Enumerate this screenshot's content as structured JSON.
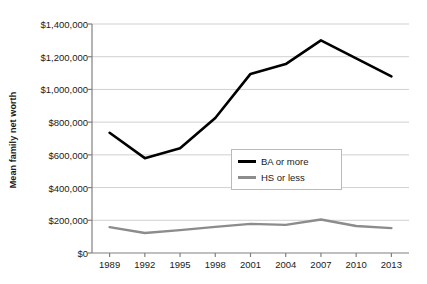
{
  "chart_data": {
    "type": "line",
    "title": "",
    "xlabel": "",
    "ylabel": "Mean family net worth",
    "x": [
      1989,
      1992,
      1995,
      1998,
      2001,
      2004,
      2007,
      2010,
      2013
    ],
    "categories": [
      "1989",
      "1992",
      "1995",
      "1998",
      "2001",
      "2004",
      "2007",
      "2010",
      "2013"
    ],
    "series": [
      {
        "name": "BA or more",
        "color": "#000000",
        "values": [
          735000,
          580000,
          640000,
          825000,
          1095000,
          1155000,
          1300000,
          1190000,
          1080000
        ]
      },
      {
        "name": "HS or less",
        "color": "#8c8c8c",
        "values": [
          158000,
          122000,
          140000,
          160000,
          178000,
          172000,
          205000,
          165000,
          152000
        ]
      }
    ],
    "ylim": [
      0,
      1400000
    ],
    "xlim": [
      1989,
      2013
    ],
    "yticks": [
      0,
      200000,
      400000,
      600000,
      800000,
      1000000,
      1200000,
      1400000
    ],
    "ytick_labels": [
      "$0",
      "$200,000",
      "$400,000",
      "$600,000",
      "$800,000",
      "$1,000,000",
      "$1,200,000",
      "$1,400,000"
    ],
    "xtick_labels": [
      "1989",
      "1992",
      "1995",
      "1998",
      "2001",
      "2004",
      "2007",
      "2010",
      "2013"
    ],
    "grid": "horizontal",
    "grid_color": "#d0d0d0",
    "legend_position": "center-right-inside",
    "legend_entries": [
      "BA or more",
      "HS or less"
    ]
  },
  "axis": {
    "y_title": "Mean family net worth"
  },
  "legend": {
    "items": [
      {
        "label": "BA or more"
      },
      {
        "label": "HS or less"
      }
    ]
  }
}
